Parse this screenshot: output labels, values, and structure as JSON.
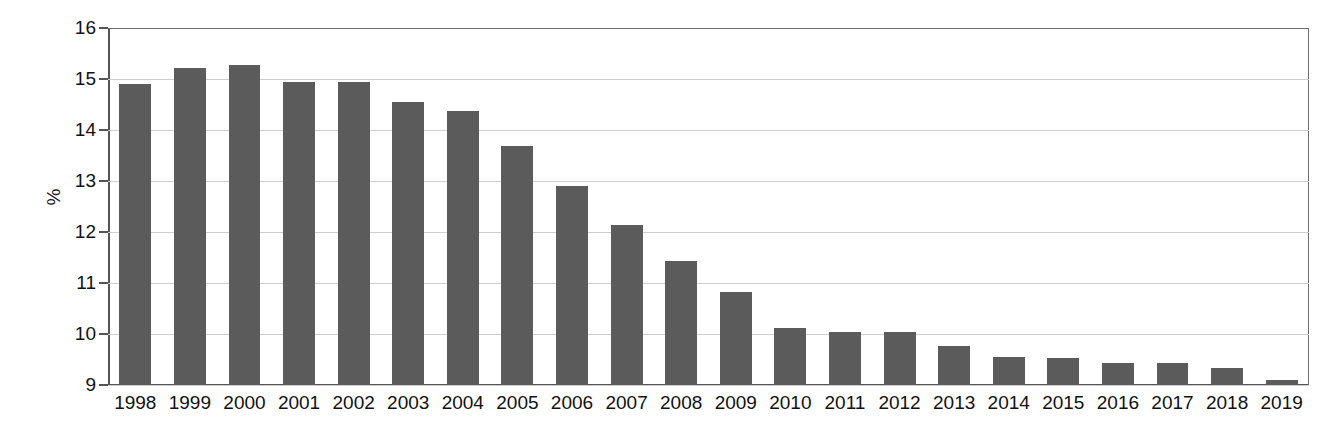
{
  "chart_data": {
    "type": "bar",
    "title": "",
    "subtitle": "",
    "xlabel": "",
    "ylabel": "%",
    "ylim": [
      9,
      16
    ],
    "yticks": [
      9,
      10,
      11,
      12,
      13,
      14,
      15,
      16
    ],
    "ytick_labels": [
      "9",
      "10",
      "11",
      "12",
      "13",
      "14",
      "15",
      "16"
    ],
    "grid": true,
    "legend": false,
    "legend_position": "none",
    "bar_color": "#5b5b5b",
    "categories": [
      "1998",
      "1999",
      "2000",
      "2001",
      "2002",
      "2003",
      "2004",
      "2005",
      "2006",
      "2007",
      "2008",
      "2009",
      "2010",
      "2011",
      "2012",
      "2013",
      "2014",
      "2015",
      "2016",
      "2017",
      "2018",
      "2019"
    ],
    "values": [
      14.9,
      15.22,
      15.28,
      14.94,
      14.94,
      14.55,
      14.37,
      13.69,
      12.9,
      12.14,
      11.43,
      10.83,
      10.12,
      10.03,
      10.03,
      9.76,
      9.55,
      9.53,
      9.43,
      9.43,
      9.33,
      9.1
    ],
    "series": [
      {
        "name": "",
        "values": [
          14.9,
          15.22,
          15.28,
          14.94,
          14.94,
          14.55,
          14.37,
          13.69,
          12.9,
          12.14,
          11.43,
          10.83,
          10.12,
          10.03,
          10.03,
          9.76,
          9.55,
          9.53,
          9.43,
          9.43,
          9.33,
          9.1
        ]
      }
    ]
  }
}
